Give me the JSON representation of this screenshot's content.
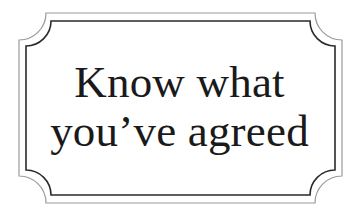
{
  "sign": {
    "line1": "Know what",
    "line2": "you’ve agreed"
  },
  "colors": {
    "background": "#ffffff",
    "outer_frame": "#9a9a9a",
    "inner_frame": "#2a2a2a",
    "text": "#1a1a1a"
  }
}
